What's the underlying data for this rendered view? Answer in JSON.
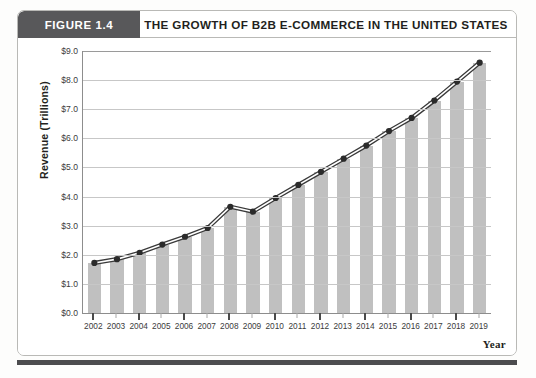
{
  "figure": {
    "tag": "FIGURE 1.4",
    "title": "THE GROWTH OF B2B E-COMMERCE IN THE UNITED STATES"
  },
  "colors": {
    "tag_background": "#58585a",
    "bar_fill": "#c0c0c0",
    "line": "#3a3a3a",
    "marker": "#2b2b2b",
    "gridline": "#c7c7c7",
    "axis": "#8d8d8d",
    "bottom_rule": "#4c4c4e"
  },
  "chart_data": {
    "type": "bar",
    "title": "THE GROWTH OF B2B E-COMMERCE IN THE UNITED STATES",
    "subtitle": "",
    "xlabel": "Year",
    "ylabel": "Revenue (Trillions)",
    "categories": [
      "2002",
      "2003",
      "2004",
      "2005",
      "2006",
      "2007",
      "2008",
      "2009",
      "2010",
      "2011",
      "2012",
      "2013",
      "2014",
      "2015",
      "2016",
      "2017",
      "2018",
      "2019"
    ],
    "values": [
      1.72,
      1.85,
      2.07,
      2.35,
      2.62,
      2.92,
      3.65,
      3.48,
      3.95,
      4.4,
      4.85,
      5.3,
      5.75,
      6.25,
      6.7,
      7.3,
      7.95,
      8.6
    ],
    "series": [
      {
        "name": "Revenue",
        "values": [
          1.72,
          1.85,
          2.07,
          2.35,
          2.62,
          2.92,
          3.65,
          3.48,
          3.95,
          4.4,
          4.85,
          5.3,
          5.75,
          6.25,
          6.7,
          7.3,
          7.95,
          8.6
        ]
      }
    ],
    "overlay": {
      "type": "line",
      "markers": true,
      "values": [
        1.72,
        1.85,
        2.07,
        2.35,
        2.62,
        2.92,
        3.65,
        3.48,
        3.95,
        4.4,
        4.85,
        5.3,
        5.75,
        6.25,
        6.7,
        7.3,
        7.95,
        8.6
      ]
    },
    "ylim": [
      0.0,
      9.0
    ],
    "ytick_step": 1.0,
    "ytick_labels": [
      "$0.0",
      "$1.0",
      "$2.0",
      "$3.0",
      "$4.0",
      "$5.0",
      "$6.0",
      "$7.0",
      "$8.0",
      "$9.0"
    ],
    "ytick_values": [
      0.0,
      1.0,
      2.0,
      3.0,
      4.0,
      5.0,
      6.0,
      7.0,
      8.0,
      9.0
    ],
    "grid": true,
    "legend": false,
    "legend_position": "none"
  }
}
